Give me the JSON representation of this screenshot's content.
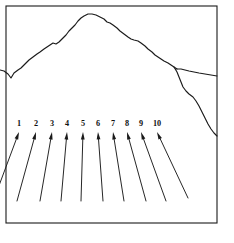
{
  "figure": {
    "title": "Mountain ridge profile with numbered sighting arrows",
    "width": 234,
    "height": 243,
    "background_color": "#ffffff",
    "ink_color": "#1a1a1a"
  },
  "frame": {
    "name": "figure-border",
    "x": 6,
    "y": 6,
    "width": 211,
    "height": 217,
    "stroke_color": "#1a1a1a"
  },
  "ridge": {
    "label": "mountain-skyline",
    "peak": {
      "x": 88,
      "y": 14
    },
    "main_path": "M 0,70 L 4,71 L 8,74 L 11,78 L 14,73 L 18,70 L 21,68 L 25,64 L 29,60 L 33,57 L 37,54 L 40,52 L 44,49 L 47,47 L 50,45 L 53,43 L 56,44 L 59,42 L 62,39 L 66,35 L 69,31 L 72,28 L 75,25 L 78,21 L 81,18 L 84,16 L 88,14 L 92,14 L 96,15 L 100,17 L 104,19 L 107,22 L 110,23 L 113,25 L 117,28 L 120,31 L 124,34 L 128,37 L 131,39 L 134,40 L 138,41 L 141,43 L 145,46 L 148,49 L 152,52 L 155,55 L 158,57 L 161,59 L 164,61 L 168,63 L 171,65 L 174,67 L 177,69",
    "branch_right_path": "M 177,69 L 181,69 L 185,70 L 189,71 L 194,72 L 199,73 L 205,74 L 211,75 L 217,76",
    "branch_down_path": "M 174,67 L 177,72 L 179,77 L 181,82 L 183,87 L 186,91 L 189,94 L 193,97 L 196,101 L 199,106 L 202,112 L 205,118 L 208,124 L 211,129 L 214,133 L 217,136"
  },
  "arrows": {
    "count": 10,
    "items": [
      {
        "number": "1",
        "label_x": 19,
        "label_y": 126,
        "tip_x": 19,
        "tip_y": 132,
        "tail_x": -6,
        "tail_y": 199
      },
      {
        "number": "2",
        "label_x": 36,
        "label_y": 126,
        "tip_x": 36,
        "tip_y": 132,
        "tail_x": 17,
        "tail_y": 201
      },
      {
        "number": "3",
        "label_x": 52,
        "label_y": 126,
        "tip_x": 52,
        "tip_y": 132,
        "tail_x": 40,
        "tail_y": 201
      },
      {
        "number": "4",
        "label_x": 67,
        "label_y": 126,
        "tip_x": 67,
        "tip_y": 132,
        "tail_x": 61,
        "tail_y": 201
      },
      {
        "number": "5",
        "label_x": 83,
        "label_y": 126,
        "tip_x": 83,
        "tip_y": 132,
        "tail_x": 81,
        "tail_y": 201
      },
      {
        "number": "6",
        "label_x": 98,
        "label_y": 126,
        "tip_x": 98,
        "tip_y": 132,
        "tail_x": 103,
        "tail_y": 201
      },
      {
        "number": "7",
        "label_x": 113,
        "label_y": 126,
        "tip_x": 113,
        "tip_y": 132,
        "tail_x": 124,
        "tail_y": 201
      },
      {
        "number": "8",
        "label_x": 127,
        "label_y": 126,
        "tip_x": 127,
        "tip_y": 132,
        "tail_x": 146,
        "tail_y": 201
      },
      {
        "number": "9",
        "label_x": 141,
        "label_y": 126,
        "tip_x": 141,
        "tip_y": 132,
        "tail_x": 166,
        "tail_y": 201
      },
      {
        "number": "10",
        "label_x": 157,
        "label_y": 126,
        "tip_x": 157,
        "tip_y": 132,
        "tail_x": 188,
        "tail_y": 198
      }
    ]
  }
}
